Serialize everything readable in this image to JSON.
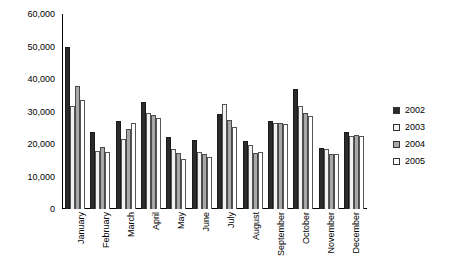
{
  "chart_data": {
    "type": "bar",
    "title": "",
    "xlabel": "",
    "ylabel": "",
    "ylim": [
      0,
      60000
    ],
    "ytick_labels": [
      "60,000",
      "50,000",
      "40,000",
      "30,000",
      "20,000",
      "10,000",
      "0"
    ],
    "ytick_values": [
      60000,
      50000,
      40000,
      30000,
      20000,
      10000,
      0
    ],
    "grid": false,
    "legend_position": "right",
    "categories": [
      "January",
      "February",
      "March",
      "April",
      "May",
      "June",
      "July",
      "August",
      "September",
      "October",
      "November",
      "December"
    ],
    "series": [
      {
        "name": "2002",
        "color": "#2b2b2b",
        "values": [
          49800,
          23600,
          27000,
          32800,
          22300,
          21200,
          29200,
          20800,
          27200,
          37000,
          18800,
          23600
        ]
      },
      {
        "name": "2003",
        "color": "#f2f2f2",
        "values": [
          31800,
          17800,
          21600,
          29600,
          18400,
          17600,
          32200,
          19600,
          26600,
          31600,
          18600,
          22600
        ]
      },
      {
        "name": "2004",
        "color": "#a8a8a8",
        "values": [
          38000,
          19000,
          24600,
          28800,
          17200,
          16800,
          27400,
          17200,
          26400,
          29600,
          16800,
          22800
        ]
      },
      {
        "name": "2005",
        "color": "#ffffff",
        "values": [
          33600,
          17400,
          26400,
          28000,
          15400,
          16000,
          25200,
          17400,
          26200,
          28600,
          17000,
          22400
        ]
      }
    ]
  },
  "legend": {
    "items": [
      {
        "label": "2002"
      },
      {
        "label": "2003"
      },
      {
        "label": "2004"
      },
      {
        "label": "2005"
      }
    ]
  }
}
